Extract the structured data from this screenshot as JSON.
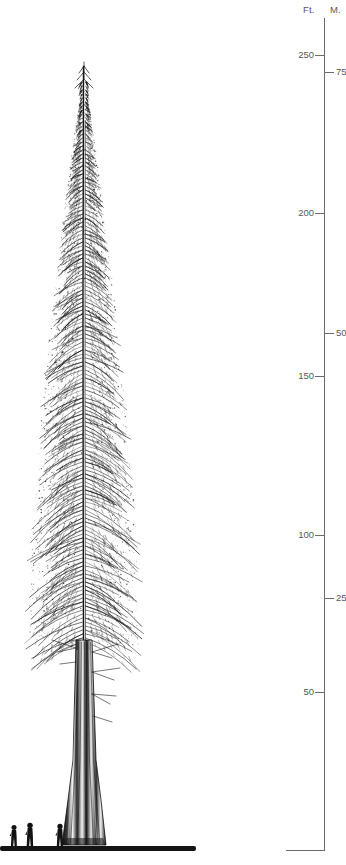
{
  "figure": {
    "style": "black-and-white pen-and-ink botanical illustration",
    "background_color": "#ffffff",
    "ink_color": "#1a1a1a",
    "axis_color": "#6b6b6d",
    "label_color": "#58585a"
  },
  "scale_bar": {
    "axis_x": 324,
    "axis_top_y": 18,
    "baseline_y": 850,
    "headers": {
      "feet": "Ft.",
      "meters": "M."
    },
    "feet_ticks": [
      {
        "label": "250",
        "y": 55
      },
      {
        "label": "200",
        "y": 213
      },
      {
        "label": "150",
        "y": 376
      },
      {
        "label": "100",
        "y": 535
      },
      {
        "label": "50",
        "y": 692
      }
    ],
    "meter_ticks": [
      {
        "label": "75",
        "y": 72
      },
      {
        "label": "50",
        "y": 333
      },
      {
        "label": "25",
        "y": 598
      }
    ]
  },
  "caption_fragment": {
    "line1": "c.",
    "line2": "r",
    "note": "clipped at left image edge"
  },
  "tree": {
    "tip_y": 62,
    "base_y": 850,
    "crown_left_x": 16,
    "crown_right_x": 148,
    "trunk_center_x": 84,
    "trunk_base_half_width": 22,
    "bare_trunk_start_y": 645
  },
  "scale_figures": [
    {
      "name": "person-left",
      "x": 14,
      "height": 22
    },
    {
      "name": "person-middle",
      "x": 30,
      "height": 24
    },
    {
      "name": "person-right",
      "x": 60,
      "height": 23
    }
  ]
}
